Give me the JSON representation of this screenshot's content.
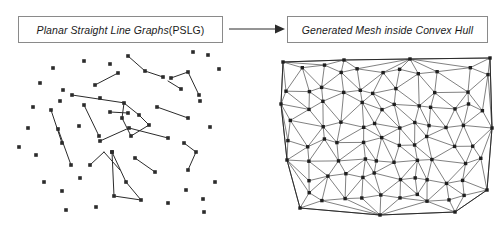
{
  "figure": {
    "width": 501,
    "height": 231,
    "background": "#ffffff",
    "ink_color": "#2b2b2b",
    "box_border_color": "#8a8a8a"
  },
  "caption_left": {
    "italic_text": "Planar Straight Line Graphs ",
    "roman_text": "(PSLG)",
    "full_text": "Planar Straight Line Graphs (PSLG)"
  },
  "caption_right": {
    "italic_text": "Generated Mesh inside Convex Hull",
    "full_text": "Generated Mesh inside Convex Hull"
  },
  "arrow": {
    "name": "flow-arrow",
    "direction": "left-to-right",
    "label": ""
  },
  "chart_data": {
    "type": "scatter",
    "panels": [
      {
        "name": "pslg-panel",
        "title": "Planar Straight Line Graphs (PSLG)",
        "marker": "square",
        "marker_size": 3.6,
        "point_color": "#2b2b2b",
        "segment_color": "#2b2b2b",
        "points": [
          [
            53,
            68
          ],
          [
            84,
            61
          ],
          [
            110,
            64
          ],
          [
            128,
            56
          ],
          [
            145,
            71
          ],
          [
            171,
            56
          ],
          [
            193,
            52
          ],
          [
            208,
            55
          ],
          [
            219,
            69
          ],
          [
            40,
            83
          ],
          [
            63,
            90
          ],
          [
            72,
            95
          ],
          [
            95,
            85
          ],
          [
            118,
            73
          ],
          [
            134,
            77
          ],
          [
            150,
            86
          ],
          [
            168,
            81
          ],
          [
            181,
            89
          ],
          [
            195,
            78
          ],
          [
            33,
            107
          ],
          [
            51,
            110
          ],
          [
            60,
            101
          ],
          [
            62,
            117
          ],
          [
            84,
            105
          ],
          [
            100,
            98
          ],
          [
            115,
            112
          ],
          [
            125,
            103
          ],
          [
            140,
            115
          ],
          [
            157,
            107
          ],
          [
            173,
            100
          ],
          [
            188,
            118
          ],
          [
            200,
            101
          ],
          [
            28,
            128
          ],
          [
            45,
            138
          ],
          [
            66,
            132
          ],
          [
            79,
            126
          ],
          [
            96,
            141
          ],
          [
            112,
            128
          ],
          [
            130,
            136
          ],
          [
            148,
            125
          ],
          [
            162,
            143
          ],
          [
            177,
            131
          ],
          [
            194,
            139
          ],
          [
            210,
            127
          ],
          [
            36,
            155
          ],
          [
            57,
            163
          ],
          [
            71,
            150
          ],
          [
            88,
            167
          ],
          [
            104,
            152
          ],
          [
            120,
            170
          ],
          [
            138,
            158
          ],
          [
            155,
            149
          ],
          [
            172,
            166
          ],
          [
            190,
            155
          ],
          [
            205,
            171
          ],
          [
            44,
            182
          ],
          [
            62,
            191
          ],
          [
            80,
            178
          ],
          [
            99,
            196
          ],
          [
            117,
            184
          ],
          [
            135,
            200
          ],
          [
            152,
            187
          ],
          [
            168,
            203
          ],
          [
            186,
            190
          ],
          [
            203,
            199
          ],
          [
            215,
            182
          ]
        ],
        "segments": [
          [
            [
              72,
              95
            ],
            [
              125,
              103
            ]
          ],
          [
            [
              110,
              64
            ],
            [
              130,
              136
            ]
          ],
          [
            [
              104,
              152
            ],
            [
              120,
              170
            ]
          ],
          [
            [
              157,
              107
            ],
            [
              188,
              118
            ]
          ],
          [
            [
              51,
              110
            ],
            [
              62,
              117
            ]
          ],
          [
            [
              130,
              136
            ],
            [
              155,
              149
            ]
          ],
          [
            [
              95,
              85
            ],
            [
              118,
              73
            ]
          ],
          [
            [
              168,
              81
            ],
            [
              181,
              89
            ]
          ],
          [
            [
              200,
              101
            ],
            [
              215,
              182
            ]
          ]
        ],
        "chains": [
          [
            [
              112,
              128
            ],
            [
              125,
              103
            ],
            [
              140,
              115
            ],
            [
              148,
              125
            ],
            [
              130,
              136
            ],
            [
              112,
              128
            ]
          ],
          [
            [
              99,
              196
            ],
            [
              104,
              152
            ],
            [
              117,
              184
            ],
            [
              135,
              200
            ],
            [
              99,
              196
            ]
          ]
        ]
      },
      {
        "name": "mesh-panel",
        "title": "Generated Mesh inside Convex Hull",
        "mesh_type": "delaunay-triangulation",
        "marker": "square",
        "marker_size": 3.4,
        "vertex_color": "#1f1f1f",
        "edge_color": "#4a4a4a",
        "hull_vertices": [
          [
            283,
            62
          ],
          [
            344,
            60
          ],
          [
            410,
            59
          ],
          [
            490,
            58
          ],
          [
            492,
            128
          ],
          [
            487,
            190
          ],
          [
            455,
            212
          ],
          [
            380,
            215
          ],
          [
            300,
            208
          ],
          [
            287,
            160
          ],
          [
            281,
            104
          ]
        ],
        "vertex_count": 96,
        "triangle_count": 168
      }
    ]
  }
}
